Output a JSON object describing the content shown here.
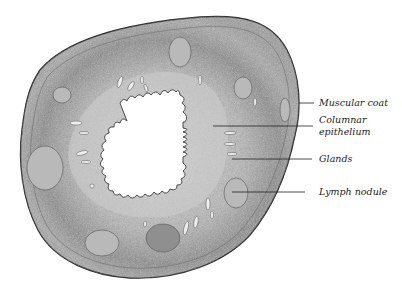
{
  "figure": {
    "colors": {
      "background": "#ffffff",
      "tissue_light": "#c9c9c9",
      "tissue_mid": "#a9a9a9",
      "tissue_dark": "#7d7d7d",
      "outline": "#2a2a2a",
      "lumen": "#ffffff",
      "leader_line": "#222222"
    },
    "labels": [
      {
        "id": "muscular-coat",
        "lines": [
          "Muscular coat"
        ]
      },
      {
        "id": "columnar-epithelium",
        "lines": [
          "Columnar",
          "epithelium"
        ]
      },
      {
        "id": "glands",
        "lines": [
          "Glands"
        ]
      },
      {
        "id": "lymph-nodule",
        "lines": [
          "Lymph nodule"
        ]
      }
    ]
  }
}
